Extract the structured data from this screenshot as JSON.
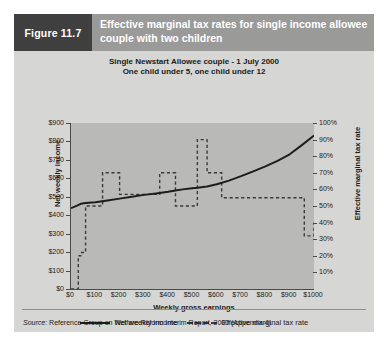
{
  "figure": {
    "number_label": "Figure 11.7",
    "title": "Effective marginal tax rates for single income allowee couple with two children",
    "source_prefix": "Source:",
    "source_text": " Reference Group on Welfare Reform Interim Report, 2000 (Appendix 4).",
    "colors": {
      "header_band": "#9a9a99",
      "number_block": "#3f3f3f",
      "panel": "#d6d6d4",
      "plot_area": "#b9b9b7",
      "net_income_line": "#1c1c1c",
      "emtr_line": "#3a3a3a"
    }
  },
  "chart_data": {
    "type": "line",
    "title": "Single Newstart Allowee couple - 1 July 2000",
    "subtitle": "One child under 5, one child under 12",
    "xlabel": "Weekly gross earnings",
    "ylabel": "Net weekly income",
    "ylabel_right": "Effective marginal tax rate",
    "grid": false,
    "legend_position": "bottom",
    "xlim": [
      0,
      1000
    ],
    "ylim": [
      0,
      900
    ],
    "ylim_right": [
      0,
      100
    ],
    "xticks": [
      "$0",
      "$100",
      "$200",
      "$300",
      "$400",
      "$500",
      "$600",
      "$700",
      "$800",
      "$900",
      "$1000"
    ],
    "xtick_values": [
      0,
      100,
      200,
      300,
      400,
      500,
      600,
      700,
      800,
      900,
      1000
    ],
    "yticks": [
      "$0",
      "$100",
      "$200",
      "$300",
      "$400",
      "$500",
      "$600",
      "$700",
      "$800",
      "$900"
    ],
    "ytick_values": [
      0,
      100,
      200,
      300,
      400,
      500,
      600,
      700,
      800,
      900
    ],
    "yticks_right": [
      "10%",
      "20%",
      "30%",
      "40%",
      "50%",
      "60%",
      "70%",
      "80%",
      "90%",
      "100%"
    ],
    "ytick_right_values": [
      10,
      20,
      30,
      40,
      50,
      60,
      70,
      80,
      90,
      100
    ],
    "series": [
      {
        "name": "Net weekly income",
        "style": "solid",
        "axis": "left",
        "x": [
          0,
          25,
          40,
          60,
          100,
          150,
          200,
          250,
          300,
          350,
          400,
          430,
          460,
          490,
          520,
          560,
          600,
          650,
          700,
          750,
          800,
          850,
          900,
          950,
          1000
        ],
        "values": [
          438,
          452,
          462,
          466,
          470,
          480,
          490,
          500,
          510,
          518,
          527,
          534,
          540,
          545,
          549,
          556,
          568,
          588,
          612,
          638,
          665,
          695,
          730,
          780,
          832
        ]
      },
      {
        "name": "Effective marginal tax rate",
        "style": "dashed",
        "axis": "right",
        "step": true,
        "x": [
          0,
          25,
          30,
          40,
          60,
          100,
          130,
          200,
          300,
          365,
          430,
          490,
          520,
          560,
          620,
          780,
          960,
          1000
        ],
        "values": [
          0,
          0,
          20,
          22,
          50,
          50,
          70,
          57,
          57,
          70,
          50,
          50,
          90,
          70,
          55,
          55,
          32,
          40
        ]
      }
    ],
    "legend": [
      {
        "label": "Net weekly income",
        "style": "solid"
      },
      {
        "label": "Effective marginal tax rate",
        "style": "dashed"
      }
    ]
  }
}
